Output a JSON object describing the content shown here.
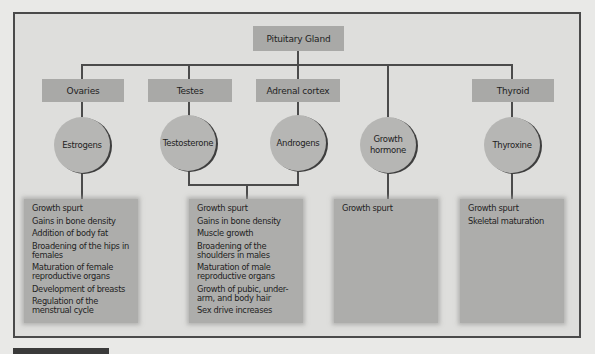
{
  "diagram": {
    "root": {
      "label": "Pituitary Gland"
    },
    "glands": [
      {
        "id": "ovaries",
        "label": "Ovaries"
      },
      {
        "id": "testes",
        "label": "Testes"
      },
      {
        "id": "adrenal-cortex",
        "label": "Adrenal cortex"
      },
      {
        "id": "thyroid",
        "label": "Thyroid"
      }
    ],
    "hormones": [
      {
        "id": "estrogens",
        "label": "Estrogens",
        "source": "Ovaries"
      },
      {
        "id": "testosterone",
        "label": "Testosterone",
        "source": "Testes"
      },
      {
        "id": "androgens",
        "label": "Androgens",
        "source": "Adrenal cortex"
      },
      {
        "id": "growth-hormone",
        "label": "Growth hormone",
        "source": "Pituitary Gland"
      },
      {
        "id": "thyroxine",
        "label": "Thyroxine",
        "source": "Thyroid"
      }
    ],
    "effects": [
      {
        "hormones": [
          "Estrogens"
        ],
        "items": [
          "Growth spurt",
          "Gains in bone density",
          "Addition of body fat",
          "Broadening of the hips in females",
          "Maturation of female reproductive organs",
          "Development of breasts",
          "Regulation of the menstrual cycle"
        ]
      },
      {
        "hormones": [
          "Testosterone",
          "Androgens"
        ],
        "items": [
          "Growth spurt",
          "Gains in bone density",
          "Muscle growth",
          "Broadening of the shoulders in males",
          "Maturation of male reproductive organs",
          "Growth of pubic, under-arm, and body hair",
          "Sex drive increases"
        ]
      },
      {
        "hormones": [
          "Growth hormone"
        ],
        "items": [
          "Growth spurt"
        ]
      },
      {
        "hormones": [
          "Thyroxine"
        ],
        "items": [
          "Growth spurt",
          "Skeletal maturation"
        ]
      }
    ]
  },
  "colors": {
    "background": "#e9e9e7",
    "frame_fill": "#dededc",
    "frame_border": "#4a4a4a",
    "box_fill": "#a9a9a7",
    "circle_fill": "#b6b6b4",
    "effects_fill": "#adadab",
    "line": "#4b4b4b"
  }
}
